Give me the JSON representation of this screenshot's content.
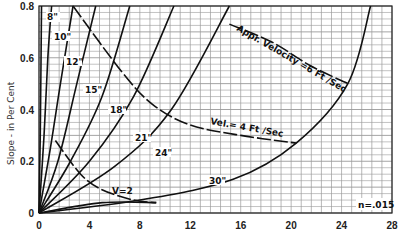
{
  "chart_data": {
    "type": "line",
    "title": "",
    "xlabel": "",
    "ylabel": "Slope - in Per Cent",
    "xlim": [
      0,
      28
    ],
    "ylim": [
      0,
      0.8
    ],
    "x_ticks": [
      "0",
      "4",
      "8",
      "12",
      "16",
      "20",
      "24",
      "28"
    ],
    "y_ticks": [
      "0",
      "0.2",
      "0.4",
      "0.6",
      "0.8"
    ],
    "grid": true,
    "annotation": "n=.015",
    "series": [
      {
        "name": "8\"",
        "style": "solid",
        "points": [
          [
            0,
            0
          ],
          [
            0.1,
            0.3
          ],
          [
            0.2,
            0.8
          ]
        ]
      },
      {
        "name": "10\"",
        "style": "solid",
        "points": [
          [
            0,
            0
          ],
          [
            0.4,
            0.3
          ],
          [
            0.7,
            0.6
          ],
          [
            1.0,
            0.8
          ]
        ]
      },
      {
        "name": "12\"",
        "style": "solid",
        "points": [
          [
            0,
            0
          ],
          [
            0.9,
            0.25
          ],
          [
            1.7,
            0.5
          ],
          [
            2.7,
            0.8
          ]
        ]
      },
      {
        "name": "15\"",
        "style": "solid",
        "points": [
          [
            0,
            0
          ],
          [
            1.5,
            0.2
          ],
          [
            3.0,
            0.5
          ],
          [
            4.5,
            0.8
          ]
        ]
      },
      {
        "name": "18\"",
        "style": "solid",
        "points": [
          [
            0,
            0
          ],
          [
            2.5,
            0.2
          ],
          [
            5.0,
            0.45
          ],
          [
            7.2,
            0.8
          ]
        ]
      },
      {
        "name": "21\"",
        "style": "solid",
        "points": [
          [
            0,
            0
          ],
          [
            4.0,
            0.2
          ],
          [
            7.5,
            0.45
          ],
          [
            10.7,
            0.8
          ]
        ]
      },
      {
        "name": "24\"",
        "style": "solid",
        "points": [
          [
            0,
            0
          ],
          [
            6.0,
            0.18
          ],
          [
            10.5,
            0.4
          ],
          [
            15.1,
            0.8
          ]
        ]
      },
      {
        "name": "30\"",
        "style": "solid",
        "points": [
          [
            0,
            0
          ],
          [
            8.0,
            0.05
          ],
          [
            15.4,
            0.13
          ],
          [
            20.4,
            0.27
          ],
          [
            24.5,
            0.5
          ],
          [
            26.3,
            0.8
          ]
        ]
      },
      {
        "name": "lower",
        "style": "solid",
        "points": [
          [
            0,
            0
          ],
          [
            5.0,
            0.04
          ],
          [
            9.3,
            0.04
          ]
        ]
      },
      {
        "name": "V=2",
        "style": "dashed",
        "points": [
          [
            1.3,
            0.28
          ],
          [
            3.3,
            0.15
          ],
          [
            5.0,
            0.09
          ],
          [
            7.5,
            0.05
          ],
          [
            9.3,
            0.04
          ]
        ]
      },
      {
        "name": "Vel.=4 Ft/Sec",
        "style": "dashed",
        "points": [
          [
            2.7,
            0.8
          ],
          [
            6.5,
            0.55
          ],
          [
            9.0,
            0.42
          ],
          [
            12.0,
            0.34
          ],
          [
            16.0,
            0.3
          ],
          [
            20.4,
            0.27
          ]
        ]
      },
      {
        "name": "Appr. Velocity=6 Ft/Sec",
        "style": "dashed",
        "points": [
          [
            15.1,
            0.73
          ],
          [
            18.5,
            0.66
          ],
          [
            21.5,
            0.57
          ],
          [
            24.5,
            0.5
          ]
        ]
      }
    ]
  },
  "labels": {
    "ylabel": "Slope - in Per Cent",
    "n_value": "n=.015",
    "curve_8": "8\"",
    "curve_10": "10\"",
    "curve_12": "12\"",
    "curve_15": "15\"",
    "curve_18": "18\"",
    "curve_21": "21\"",
    "curve_24": "24\"",
    "curve_30": "30\"",
    "v2": "V=2",
    "vel4": "Vel.= 4 Ft /Sec",
    "vel6": "Appr. Velocity =6 Ft /Sec"
  }
}
